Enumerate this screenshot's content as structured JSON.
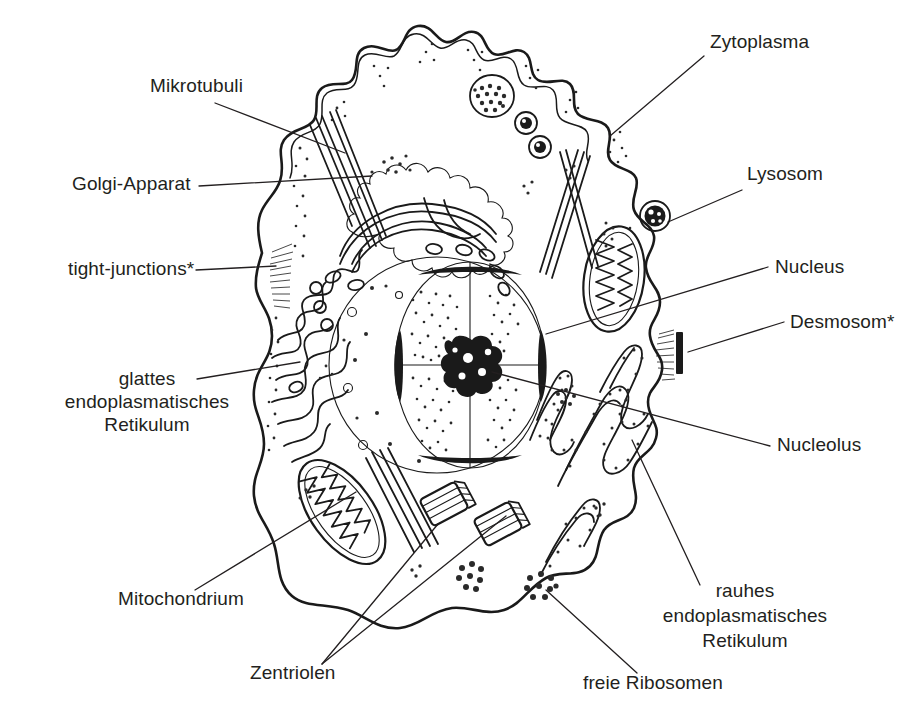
{
  "figure": {
    "background_color": "#ffffff",
    "ink_color": "#1a1a1a",
    "text_color": "#231f20"
  },
  "labels": [
    {
      "id": "mikrotubuli",
      "text": "Mikrotubuli",
      "x": 150,
      "y": 92,
      "align": "start"
    },
    {
      "id": "golgi",
      "text": "Golgi-Apparat",
      "x": 72,
      "y": 190,
      "align": "start"
    },
    {
      "id": "tight",
      "text": "tight-junctions*",
      "x": 68,
      "y": 275,
      "align": "start"
    },
    {
      "id": "ser1",
      "text": "glattes",
      "x": 147,
      "y": 385,
      "align": "mid"
    },
    {
      "id": "ser2",
      "text": "endoplasmatisches",
      "x": 147,
      "y": 408,
      "align": "mid"
    },
    {
      "id": "ser3",
      "text": "Retikulum",
      "x": 147,
      "y": 431,
      "align": "mid"
    },
    {
      "id": "mitochondrium",
      "text": "Mitochondrium",
      "x": 118,
      "y": 605,
      "align": "start"
    },
    {
      "id": "zentriolen",
      "text": "Zentriolen",
      "x": 250,
      "y": 679,
      "align": "start"
    },
    {
      "id": "ribosomen",
      "text": "freie Ribosomen",
      "x": 583,
      "y": 689,
      "align": "start"
    },
    {
      "id": "rer1",
      "text": "rauhes",
      "x": 745,
      "y": 597,
      "align": "mid"
    },
    {
      "id": "rer2",
      "text": "endoplasmatisches",
      "x": 745,
      "y": 622,
      "align": "mid"
    },
    {
      "id": "rer3",
      "text": "Retikulum",
      "x": 745,
      "y": 647,
      "align": "mid"
    },
    {
      "id": "zytoplasma",
      "text": "Zytoplasma",
      "x": 710,
      "y": 48,
      "align": "start"
    },
    {
      "id": "lysosom",
      "text": "Lysosom",
      "x": 747,
      "y": 180,
      "align": "start"
    },
    {
      "id": "nucleus",
      "text": "Nucleus",
      "x": 775,
      "y": 273,
      "align": "start"
    },
    {
      "id": "desmosom",
      "text": "Desmosom*",
      "x": 790,
      "y": 328,
      "align": "start"
    },
    {
      "id": "nucleolus",
      "text": "Nucleolus",
      "x": 777,
      "y": 451,
      "align": "start"
    }
  ],
  "organelles": [
    {
      "id": "zellmembran",
      "name": "Zellmembran mit Mikrovilli"
    },
    {
      "id": "nucleus",
      "name": "Nucleus (Zellkern)"
    },
    {
      "id": "nucleolus",
      "name": "Nucleolus (Kernkörperchen)"
    },
    {
      "id": "golgi",
      "name": "Golgi-Apparat"
    },
    {
      "id": "mitochondrium-links",
      "name": "Mitochondrium links"
    },
    {
      "id": "mitochondrium-rechts",
      "name": "Mitochondrium rechts"
    },
    {
      "id": "glattes-er",
      "name": "glattes endoplasmatisches Retikulum"
    },
    {
      "id": "rauhes-er",
      "name": "rauhes endoplasmatisches Retikulum"
    },
    {
      "id": "lysosom",
      "name": "Lysosom"
    },
    {
      "id": "zentriol-1",
      "name": "Zentriol 1"
    },
    {
      "id": "zentriol-2",
      "name": "Zentriol 2"
    },
    {
      "id": "mikrotubuli",
      "name": "Mikrotubuli-Bündel"
    },
    {
      "id": "freie-ribosomen",
      "name": "freie Ribosomen"
    },
    {
      "id": "tight-junctions",
      "name": "tight-junctions"
    },
    {
      "id": "desmosom",
      "name": "Desmosom"
    }
  ],
  "footnote_marker": "*"
}
